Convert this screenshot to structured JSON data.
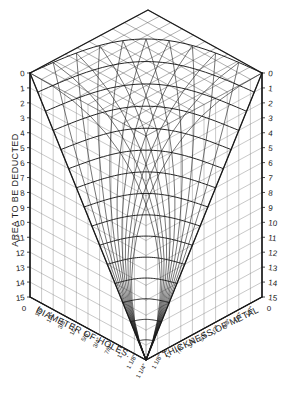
{
  "chart_data": {
    "type": "line",
    "subtitle": "",
    "xlabel": "Diameter of Holes.",
    "xlabel_right": "Thickness of Metal",
    "ylabel": "Area to be Deducted",
    "grid": true,
    "legend": "none",
    "ylim": [
      0,
      15
    ],
    "y_ticks_left": [
      "0",
      "1",
      "2",
      "3",
      "4",
      "5",
      "6",
      "7",
      "8",
      "9",
      "10",
      "11",
      "12",
      "13",
      "14",
      "15"
    ],
    "y_ticks_right": [
      "0",
      "1",
      "2",
      "3",
      "4",
      "5",
      "6",
      "7",
      "8",
      "9",
      "10",
      "11",
      "12",
      "13",
      "14",
      "15"
    ],
    "x_ticks_left": [
      "0",
      "1/8\"",
      "1/4\"",
      "3/8\"",
      "1/2\"",
      "5/8\"",
      "3/4\"",
      "7/8\"",
      "1\"",
      "1 1/8\"",
      "1 1/4\""
    ],
    "x_ticks_right": [
      "1 1/4\"",
      "1 1/8\"",
      "1\"",
      "7/8\"",
      "3/4\"",
      "5/8\"",
      "1/2\"",
      "3/8\"",
      "1/4\"",
      "1/8\"",
      "0"
    ],
    "left_axis_corner_label": "0",
    "right_axis_corner_label": "0",
    "bottom_apex_label": "1 1/4\"",
    "x": [
      0,
      1,
      2,
      3,
      4,
      5,
      6,
      7,
      8,
      9,
      10
    ],
    "series": [
      {
        "name": "contour-0",
        "level": 0,
        "values": [
          0,
          0,
          0,
          0,
          0,
          0,
          0,
          0,
          0,
          0,
          0
        ]
      },
      {
        "name": "contour-1",
        "level": 1,
        "values": [
          1,
          1,
          1,
          1,
          1,
          1,
          1,
          1,
          1,
          1,
          1
        ]
      },
      {
        "name": "contour-2",
        "level": 2,
        "values": [
          2,
          2,
          2,
          2,
          2,
          2,
          2,
          2,
          2,
          2,
          2
        ]
      },
      {
        "name": "contour-3",
        "level": 3,
        "values": [
          3,
          3,
          3,
          3,
          3,
          3,
          3,
          3,
          3,
          3,
          3
        ]
      },
      {
        "name": "contour-4",
        "level": 4,
        "values": [
          4,
          4,
          4,
          4,
          4,
          4,
          4,
          4,
          4,
          4,
          4
        ]
      },
      {
        "name": "contour-5",
        "level": 5,
        "values": [
          5,
          5,
          5,
          5,
          5,
          5,
          5,
          5,
          5,
          5,
          5
        ]
      },
      {
        "name": "contour-6",
        "level": 6,
        "values": [
          6,
          6,
          6,
          6,
          6,
          6,
          6,
          6,
          6,
          6,
          6
        ]
      },
      {
        "name": "contour-7",
        "level": 7,
        "values": [
          7,
          7,
          7,
          7,
          7,
          7,
          7,
          7,
          7,
          7,
          7
        ]
      },
      {
        "name": "contour-8",
        "level": 8,
        "values": [
          8,
          8,
          8,
          8,
          8,
          8,
          8,
          8,
          8,
          8,
          8
        ]
      },
      {
        "name": "contour-9",
        "level": 9,
        "values": [
          9,
          9,
          9,
          9,
          9,
          9,
          9,
          9,
          9,
          9,
          9
        ]
      },
      {
        "name": "contour-10",
        "level": 10,
        "values": [
          10,
          10,
          10,
          10,
          10,
          10,
          10,
          10,
          10,
          10,
          10
        ]
      },
      {
        "name": "contour-11",
        "level": 11,
        "values": [
          11,
          11,
          11,
          11,
          11,
          11,
          11,
          11,
          11,
          11,
          11
        ]
      },
      {
        "name": "contour-12",
        "level": 12,
        "values": [
          12,
          12,
          12,
          12,
          12,
          12,
          12,
          12,
          12,
          12,
          12
        ]
      },
      {
        "name": "contour-13",
        "level": 13,
        "values": [
          13,
          13,
          13,
          13,
          13,
          13,
          13,
          13,
          13,
          13,
          13
        ]
      },
      {
        "name": "contour-14",
        "level": 14,
        "values": [
          14,
          14,
          14,
          14,
          14,
          14,
          14,
          14,
          14,
          14,
          14
        ]
      },
      {
        "name": "contour-15",
        "level": 15,
        "values": [
          15,
          15,
          15,
          15,
          15,
          15,
          15,
          15,
          15,
          15,
          15
        ]
      }
    ],
    "colors": {
      "line": "#1a1a1a",
      "grid": "#555555",
      "background": "#ffffff"
    }
  },
  "axes": {
    "left": {
      "title": "AREA TO BE DEDUCTED",
      "ticks": [
        "0",
        "1",
        "2",
        "3",
        "4",
        "5",
        "6",
        "7",
        "8",
        "9",
        "10",
        "11",
        "12",
        "13",
        "14",
        "15"
      ],
      "base_label": "0"
    },
    "right": {
      "ticks": [
        "0",
        "1",
        "2",
        "3",
        "4",
        "5",
        "6",
        "7",
        "8",
        "9",
        "10",
        "11",
        "12",
        "13",
        "14",
        "15"
      ],
      "base_label": "0"
    },
    "bottom_left": {
      "title": "DIAMETER OF HOLES.",
      "ticks": [
        "1/8\"",
        "1/4\"",
        "3/8\"",
        "1/2\"",
        "5/8\"",
        "3/4\"",
        "7/8\"",
        "1\"",
        "1 1/8\""
      ],
      "apex": "1 1/4\""
    },
    "bottom_right": {
      "title": "THICKNESS OF METAL",
      "ticks": [
        "1 1/8\"",
        "1\"",
        "7/8\"",
        "3/4\"",
        "5/8\"",
        "1/2\"",
        "3/8\"",
        "1/4\"",
        "1/8\""
      ]
    }
  },
  "footer": {
    "caption": ""
  }
}
